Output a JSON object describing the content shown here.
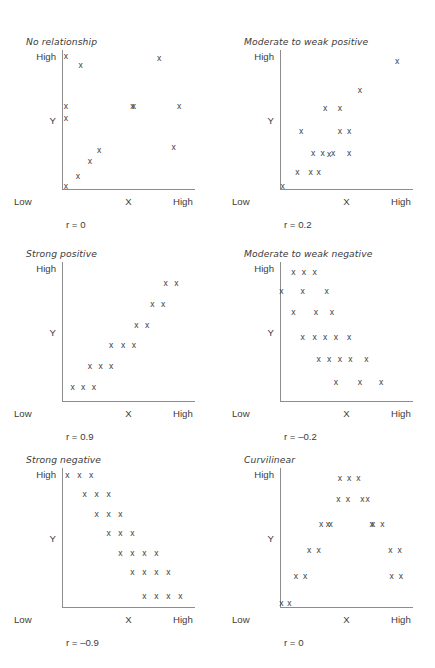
{
  "figure": {
    "labels": {
      "y_high": "High",
      "y_axis": "Y",
      "y_low": "Low",
      "x_axis": "X",
      "x_high": "High"
    },
    "point_glyph": "x"
  },
  "chart_data": [
    {
      "type": "scatter",
      "title": "No relationship",
      "xlabel": "X",
      "ylabel": "Y",
      "xlim": [
        0,
        100
      ],
      "ylim": [
        0,
        100
      ],
      "xtick_labels": [
        "Low",
        "X",
        "High"
      ],
      "ytick_labels": [
        "High",
        "Y",
        "Low"
      ],
      "grid": false,
      "annotation": "r = 0",
      "r": 0,
      "x": [
        3,
        14,
        3,
        3,
        28,
        21,
        12,
        3,
        53,
        54,
        73,
        88,
        84
      ],
      "y": [
        96,
        89,
        60,
        51,
        28,
        20,
        9,
        2,
        60,
        60,
        94,
        60,
        30
      ]
    },
    {
      "type": "scatter",
      "title": "Moderate to weak positive",
      "xlabel": "X",
      "ylabel": "Y",
      "xlim": [
        0,
        100
      ],
      "ylim": [
        0,
        100
      ],
      "xtick_labels": [
        "Low",
        "X",
        "High"
      ],
      "ytick_labels": [
        "High",
        "Y",
        "Low"
      ],
      "grid": false,
      "annotation": "r = 0.2",
      "r": 0.2,
      "x": [
        2,
        13,
        23,
        29,
        37,
        16,
        25,
        32,
        40,
        34,
        45,
        52,
        45,
        52,
        60,
        88
      ],
      "y": [
        2,
        12,
        12,
        12,
        25,
        42,
        26,
        26,
        26,
        58,
        42,
        42,
        58,
        26,
        71,
        92
      ]
    },
    {
      "type": "scatter",
      "title": "Strong positive",
      "xlabel": "X",
      "ylabel": "Y",
      "xlim": [
        0,
        100
      ],
      "ylim": [
        0,
        100
      ],
      "xtick_labels": [
        "Low",
        "X",
        "High"
      ],
      "ytick_labels": [
        "High",
        "Y",
        "Low"
      ],
      "grid": false,
      "annotation": "r = 0.9",
      "r": 0.9,
      "x": [
        8,
        16,
        24,
        21,
        29,
        37,
        37,
        46,
        54,
        56,
        64,
        68,
        76,
        78,
        86
      ],
      "y": [
        10,
        10,
        10,
        25,
        25,
        25,
        40,
        40,
        40,
        55,
        55,
        70,
        70,
        85,
        85
      ]
    },
    {
      "type": "scatter",
      "title": "Moderate to weak negative",
      "xlabel": "X",
      "ylabel": "Y",
      "xlim": [
        0,
        100
      ],
      "ylim": [
        0,
        100
      ],
      "xtick_labels": [
        "Low",
        "X",
        "High"
      ],
      "ytick_labels": [
        "High",
        "Y",
        "Low"
      ],
      "grid": false,
      "annotation": "r = –0.2",
      "r": -0.2,
      "x": [
        10,
        18,
        26,
        1,
        17,
        35,
        10,
        27,
        39,
        17,
        26,
        34,
        42,
        52,
        29,
        37,
        45,
        53,
        65,
        42,
        60,
        76
      ],
      "y": [
        93,
        93,
        93,
        79,
        79,
        79,
        64,
        64,
        64,
        46,
        46,
        46,
        46,
        46,
        30,
        30,
        30,
        30,
        30,
        14,
        14,
        14
      ]
    },
    {
      "type": "scatter",
      "title": "Strong negative",
      "xlabel": "X",
      "ylabel": "Y",
      "xlim": [
        0,
        100
      ],
      "ylim": [
        0,
        100
      ],
      "xtick_labels": [
        "Low",
        "X",
        "High"
      ],
      "ytick_labels": [
        "High",
        "Y",
        "Low"
      ],
      "grid": false,
      "annotation": "r = –0.9",
      "r": -0.9,
      "x": [
        4,
        13,
        22,
        17,
        26,
        35,
        26,
        35,
        44,
        35,
        44,
        53,
        44,
        53,
        62,
        71,
        53,
        62,
        71,
        80,
        62,
        71,
        80,
        89
      ],
      "y": [
        95,
        95,
        95,
        81,
        81,
        81,
        67,
        67,
        67,
        53,
        53,
        53,
        39,
        39,
        39,
        39,
        25,
        25,
        25,
        25,
        8,
        8,
        8,
        8
      ]
    },
    {
      "type": "scatter",
      "title": "Curvilinear",
      "xlabel": "X",
      "ylabel": "Y",
      "xlim": [
        0,
        100
      ],
      "ylim": [
        0,
        100
      ],
      "xtick_labels": [
        "Low",
        "X",
        "High"
      ],
      "ytick_labels": [
        "High",
        "Y",
        "Low"
      ],
      "grid": false,
      "annotation": "r = 0",
      "r": 0,
      "x": [
        1,
        7,
        12,
        19,
        22,
        29,
        36,
        31,
        38,
        44,
        51,
        45,
        52,
        59,
        66,
        62,
        69,
        70,
        77,
        83,
        90,
        84,
        91
      ],
      "y": [
        3,
        3,
        22,
        22,
        41,
        41,
        60,
        60,
        60,
        78,
        78,
        93,
        93,
        93,
        78,
        78,
        60,
        60,
        60,
        41,
        41,
        22,
        22
      ]
    }
  ]
}
